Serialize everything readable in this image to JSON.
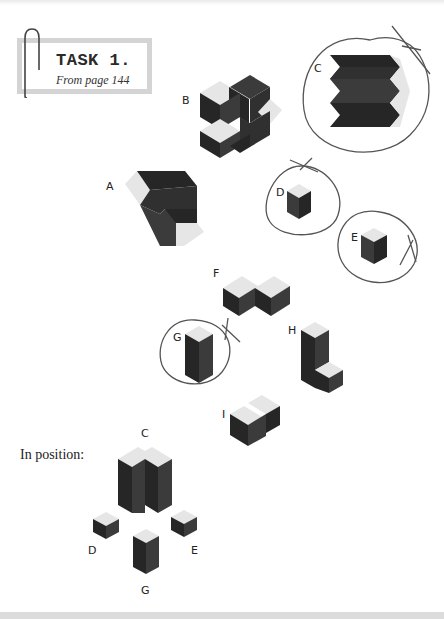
{
  "task": {
    "title": "TASK 1.",
    "subtitle": "From page 144"
  },
  "pieces": {
    "A": "A",
    "B": "B",
    "C": "C",
    "D": "D",
    "E": "E",
    "F": "F",
    "G": "G",
    "H": "H",
    "I": "I"
  },
  "circled_pieces": [
    "C",
    "D",
    "E",
    "G"
  ],
  "in_position": {
    "label": "In position:",
    "labels": {
      "C": "C",
      "D": "D",
      "E": "E",
      "G": "G"
    }
  },
  "colors": {
    "top_face": "#e6e6e6",
    "left_face": "#3a3a3a",
    "right_face": "#262626",
    "mid_face": "#2f2f2f",
    "outline": "#4a4a4a"
  },
  "icons": [
    "paperclip-icon"
  ]
}
